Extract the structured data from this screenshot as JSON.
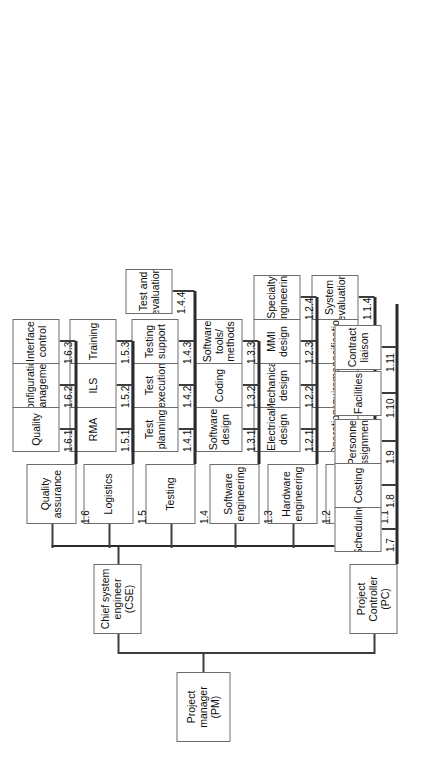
{
  "diagram": {
    "orientation": "rotated-90",
    "box_border_color": "#6d6d6d",
    "line_color": "#3d3d3d",
    "background": "#ffffff"
  },
  "root": {
    "label": "Project\nmanager (PM)",
    "line1": "Project",
    "line2": "manager (PM)"
  },
  "branches": [
    {
      "id": "cse",
      "line1": "Chief system",
      "line2": "engineer (CSE)",
      "children": [
        {
          "wbs": "1.1",
          "line1": "Systems",
          "line2": "engineering",
          "children": [
            {
              "wbs": "1.1.1",
              "line1": "Operations",
              "line2": ""
            },
            {
              "wbs": "1.1.2",
              "line1": "Requirements",
              "line2": ""
            },
            {
              "wbs": "1.1.3",
              "line1": "Specifications",
              "line2": ""
            },
            {
              "wbs": "1.1.4",
              "line1": "System",
              "line2": "evaluation"
            }
          ]
        },
        {
          "wbs": "1.2",
          "line1": "Hardware",
          "line2": "engineering",
          "children": [
            {
              "wbs": "1.2.1",
              "line1": "Electrical",
              "line2": "design"
            },
            {
              "wbs": "1.2.2",
              "line1": "Mechanical",
              "line2": "design"
            },
            {
              "wbs": "1.2.3",
              "line1": "MMI",
              "line2": "design"
            },
            {
              "wbs": "1.2.4",
              "line1": "Specialty",
              "line2": "engineering"
            }
          ]
        },
        {
          "wbs": "1.3",
          "line1": "Software",
          "line2": "engineering",
          "children": [
            {
              "wbs": "1.3.1",
              "line1": "Software",
              "line2": "design"
            },
            {
              "wbs": "1.3.2",
              "line1": "Coding",
              "line2": ""
            },
            {
              "wbs": "1.3.3",
              "line1": "Software",
              "line2": "tools/",
              "line3": "methods"
            }
          ]
        },
        {
          "wbs": "1.4",
          "line1": "Testing",
          "line2": "",
          "children": [
            {
              "wbs": "1.4.1",
              "line1": "Test",
              "line2": "planning"
            },
            {
              "wbs": "1.4.2",
              "line1": "Test",
              "line2": "execution"
            },
            {
              "wbs": "1.4.3",
              "line1": "Testing",
              "line2": "support"
            },
            {
              "wbs": "1.4.4",
              "line1": "Test and",
              "line2": "evaluation"
            }
          ]
        },
        {
          "wbs": "1.5",
          "line1": "Logistics",
          "line2": "",
          "children": [
            {
              "wbs": "1.5.1",
              "line1": "RMA",
              "line2": ""
            },
            {
              "wbs": "1.5.2",
              "line1": "ILS",
              "line2": ""
            },
            {
              "wbs": "1.5.3",
              "line1": "Training",
              "line2": ""
            }
          ]
        },
        {
          "wbs": "1.6",
          "line1": "Quality",
          "line2": "assurance",
          "children": [
            {
              "wbs": "1.6.1",
              "line1": "Quality",
              "line2": ""
            },
            {
              "wbs": "1.6.2",
              "line1": "Configuration",
              "line2": "management"
            },
            {
              "wbs": "1.6.3",
              "line1": "Interface",
              "line2": "control"
            }
          ]
        }
      ]
    },
    {
      "id": "pc",
      "line1": "Project",
      "line2": "Controller (PC)",
      "children": [
        {
          "wbs": "1.7",
          "line1": "Scheduling",
          "line2": ""
        },
        {
          "wbs": "1.8",
          "line1": "Costing",
          "line2": ""
        },
        {
          "wbs": "1.9",
          "line1": "Personnel",
          "line2": "assignments"
        },
        {
          "wbs": "1.10",
          "line1": "Facilities",
          "line2": ""
        },
        {
          "wbs": "1.11",
          "line1": "Contract",
          "line2": "liaison"
        }
      ]
    }
  ]
}
